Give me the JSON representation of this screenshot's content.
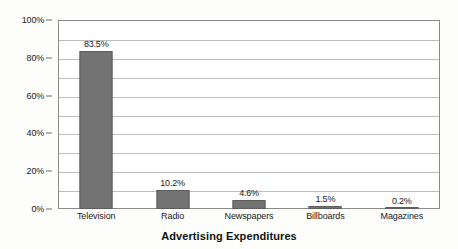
{
  "chart_data": {
    "type": "bar",
    "title": "Advertising Expenditures",
    "xlabel": "",
    "ylabel": "",
    "categories": [
      "Television",
      "Radio",
      "Newspapers",
      "Billboards",
      "Magazines"
    ],
    "values": [
      83.5,
      10.2,
      4.6,
      1.5,
      0.2
    ],
    "value_labels": [
      "83.5%",
      "10.2%",
      "4.6%",
      "1.5%",
      "0.2%"
    ],
    "ylim": [
      0,
      100
    ],
    "y_tick_values": [
      0,
      20,
      40,
      60,
      80,
      100
    ],
    "y_tick_labels": [
      "0%",
      "20%",
      "40%",
      "60%",
      "80%",
      "100%"
    ],
    "gridline_values": [
      10,
      20,
      30,
      40,
      50,
      60,
      70,
      80,
      90,
      100
    ],
    "grid": true,
    "legend": false,
    "legend_position": "none",
    "bar_color": "#737373",
    "bar_edge_color": "#5E5E5E",
    "gridline_color": "#BDBDBD",
    "axis_color": "#8A8A8A",
    "plot_background": "#FFFFFF",
    "figure_background": "#FDFDFB"
  }
}
